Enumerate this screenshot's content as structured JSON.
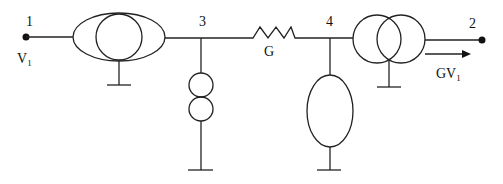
{
  "diagram": {
    "type": "equivalent-circuit",
    "nodes": [
      {
        "id": "1",
        "label": "1",
        "voltage_label": "V",
        "voltage_sub": "1"
      },
      {
        "id": "2",
        "label": "2"
      },
      {
        "id": "3",
        "label": "3"
      },
      {
        "id": "4",
        "label": "4"
      }
    ],
    "resistor": {
      "label": "G"
    },
    "output_arrow": {
      "label": "GV",
      "sub": "1"
    },
    "components": [
      "transformer-between-node1-and-node3",
      "double-circle-source-at-node3-to-ground",
      "resistor-G-between-node3-and-node4",
      "ellipse-element-at-node4-to-ground",
      "transformer-between-node4-and-node2"
    ],
    "colors": {
      "line": "#222222",
      "background": "#ffffff"
    }
  }
}
